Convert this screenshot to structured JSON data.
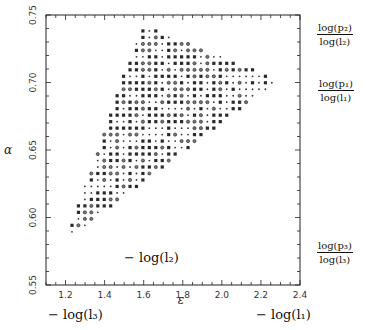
{
  "chart_data": {
    "type": "scatter",
    "title": "",
    "xlabel": "ε",
    "ylabel": "α",
    "xlim": [
      1.1,
      2.4
    ],
    "ylim": [
      0.55,
      0.75
    ],
    "xticks": [
      1.2,
      1.4,
      1.6,
      1.8,
      2.0,
      2.2,
      2.4
    ],
    "xtick_labels": [
      "1.2",
      "1.4",
      "1.6",
      "1.8",
      "2.0",
      "2.2",
      "2.4"
    ],
    "yticks": [
      0.55,
      0.6,
      0.65,
      0.7,
      0.75
    ],
    "ytick_labels": [
      "0.55",
      "0.60",
      "0.65",
      "0.70",
      "0.75"
    ],
    "grid": false,
    "region": {
      "description": "Triangular region of admissible (ε, α) points shown as a dense lattice of markers",
      "vertices": [
        {
          "x": 1.2,
          "y": 0.583
        },
        {
          "x": 1.59,
          "y": 0.743
        },
        {
          "x": 2.29,
          "y": 0.702
        }
      ],
      "lattice_step": {
        "x": 0.033,
        "y": 0.0048
      },
      "marker_styles": [
        "filled-square",
        "open-circle",
        "small-cross"
      ]
    },
    "annotations": {
      "bottom_left": "− log(l₃)",
      "bottom_right": "− log(l₁)",
      "inside_lower": "− log(l₂)",
      "right_labels": [
        {
          "numerator": "log(p₂)",
          "denominator": "log(l₂)",
          "y": 0.742
        },
        {
          "numerator": "log(p₁)",
          "denominator": "log(l₁)",
          "y": 0.702
        },
        {
          "numerator": "log(p₃)",
          "denominator": "log(l₃)",
          "y": 0.57
        }
      ]
    }
  }
}
